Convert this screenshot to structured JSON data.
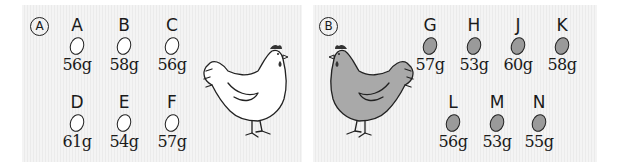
{
  "panels": {
    "a": {
      "label": "Ⓐ",
      "label_text": "A",
      "hen_color": "#ffffff",
      "egg_color": "#ffffff",
      "eggs": [
        {
          "id": "A",
          "weight": "56g"
        },
        {
          "id": "B",
          "weight": "58g"
        },
        {
          "id": "C",
          "weight": "56g"
        },
        {
          "id": "D",
          "weight": "61g"
        },
        {
          "id": "E",
          "weight": "54g"
        },
        {
          "id": "F",
          "weight": "57g"
        }
      ]
    },
    "b": {
      "label": "Ⓑ",
      "label_text": "B",
      "hen_color": "#a9a9a9",
      "egg_color": "#9a9a9a",
      "eggs": [
        {
          "id": "G",
          "weight": "57g"
        },
        {
          "id": "H",
          "weight": "53g"
        },
        {
          "id": "J",
          "weight": "60g"
        },
        {
          "id": "K",
          "weight": "58g"
        },
        {
          "id": "L",
          "weight": "56g"
        },
        {
          "id": "M",
          "weight": "53g"
        },
        {
          "id": "N",
          "weight": "55g"
        }
      ]
    }
  }
}
